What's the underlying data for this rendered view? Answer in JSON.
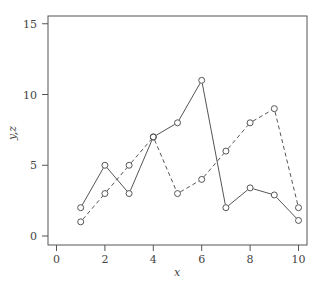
{
  "chart_data": {
    "type": "line",
    "title": "",
    "xlabel": "x",
    "ylabel": "y,z",
    "xlim": [
      -0.3,
      10.4
    ],
    "ylim": [
      -0.6,
      15.6
    ],
    "x_ticks": [
      "0",
      "2",
      "4",
      "6",
      "8",
      "10"
    ],
    "y_ticks": [
      "0",
      "5",
      "10",
      "15"
    ],
    "grid": false,
    "legend": null,
    "x": [
      1,
      2,
      3,
      4,
      5,
      6,
      7,
      8,
      9,
      10
    ],
    "series": [
      {
        "name": "y",
        "style": "solid",
        "marker": "open-circle",
        "values": [
          2,
          5,
          3,
          7,
          8,
          11,
          2,
          3.4,
          2.9,
          1.1
        ]
      },
      {
        "name": "z",
        "style": "dashed",
        "marker": "open-circle",
        "values": [
          1,
          3,
          5,
          7,
          3,
          4,
          6,
          8,
          9,
          2
        ]
      }
    ]
  }
}
